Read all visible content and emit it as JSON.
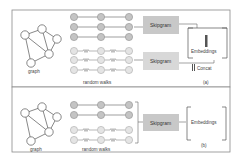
{
  "panel_a": {
    "graph_label": "graph",
    "walks_label": "random walks",
    "skipgram_top": "Skipgram",
    "skipgram_bottom": "Skipgram",
    "embeddings_label": "Embeddings",
    "concat_label": "Concat",
    "caption": "(a)"
  },
  "panel_b": {
    "graph_label": "graph",
    "walks_label": "random walks",
    "skipgram": "Skipgram",
    "embeddings_label": "Embeddings",
    "caption": "(b)"
  },
  "colors": {
    "border": "#8a8a8a",
    "skipgram_fill": "#c8c8c8",
    "node_dark": "#c4c4c4",
    "node_light": "#e2e2e2",
    "line": "#777777"
  }
}
